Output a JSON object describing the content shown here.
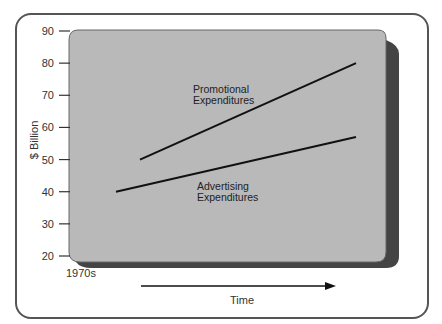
{
  "chart_data": {
    "type": "line",
    "title": "",
    "xlabel": "Time",
    "ylabel": "$ Billion",
    "ylim": [
      20,
      90
    ],
    "yticks": [
      20,
      30,
      40,
      50,
      60,
      70,
      80,
      90
    ],
    "x_start_label": "1970s",
    "grid": false,
    "legend": "none (inline labels)",
    "x": [
      0,
      1
    ],
    "series": [
      {
        "name": "Promotional Expenditures",
        "label_lines": [
          "Promotional",
          "Expenditures"
        ],
        "x": [
          0.1,
          1
        ],
        "values": [
          50,
          80
        ]
      },
      {
        "name": "Advertising Expenditures",
        "label_lines": [
          "Advertising",
          "Expenditures"
        ],
        "x": [
          0,
          1
        ],
        "values": [
          40,
          57
        ]
      }
    ]
  },
  "colors": {
    "panel": "#b9b9b9",
    "shadow": "#444444",
    "line": "#111111",
    "frame": "#555555"
  }
}
